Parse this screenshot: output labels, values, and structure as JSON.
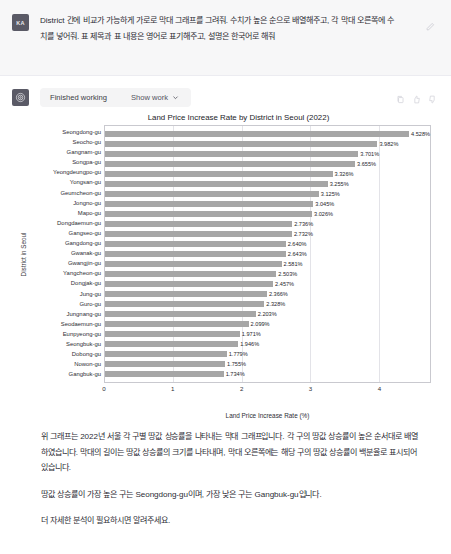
{
  "user": {
    "avatar_initials": "KA",
    "message": "District 간에 비교가 가능하게 가로로 막대 그래프를 그려줘. 수치가 높은 순으로 배열해주고, 각 막대 오른쪽에 수치를 넣어줘. 표 제목과 표 내용은 영어로 표기해주고, 설명은 한국어로 해줘",
    "edit_icon": "edit-icon"
  },
  "assistant": {
    "tool_status": "Finished working",
    "show_work_label": "Show work",
    "chevron_icon": "chevron-down-icon",
    "actions": [
      {
        "name": "copy-icon"
      },
      {
        "name": "thumbs-up-icon"
      },
      {
        "name": "thumbs-down-icon"
      }
    ],
    "paragraphs": [
      "위 그래프는 2022년 서울 각 구별 땅값 상승률을 나타내는 막대 그래프입니다. 각 구의 땅값 상승률이 높은 순서대로 배열하였습니다. 막대의 길이는 땅값 상승률의 크기를 나타내며, 막대 오른쪽에는 해당 구의 땅값 상승률이 백분율로 표시되어 있습니다.",
      "땅값 상승률이 가장 높은 구는 Seongdong-gu이며, 가장 낮은 구는 Gangbuk-gu입니다.",
      "더 자세한 분석이 필요하시면 알려주세요."
    ]
  },
  "chart_data": {
    "type": "bar",
    "orientation": "horizontal",
    "title": "Land Price Increase Rate by District in Seoul (2022)",
    "xlabel": "Land Price Increase Rate (%)",
    "ylabel": "District in Seoul",
    "xlim": [
      0,
      4.75
    ],
    "xticks": [
      0,
      1,
      2,
      3,
      4
    ],
    "grid": true,
    "bar_color": "#a6a6a6",
    "categories": [
      "Seongdong-gu",
      "Seocho-gu",
      "Gangnam-gu",
      "Songpa-gu",
      "Yeongdeungpo-gu",
      "Yongsan-gu",
      "Geumcheon-gu",
      "Jongno-gu",
      "Mapo-gu",
      "Dongdaemun-gu",
      "Gangseo-gu",
      "Gangdong-gu",
      "Gwanak-gu",
      "Gwangjin-gu",
      "Yangcheon-gu",
      "Dongjak-gu",
      "Jung-gu",
      "Guro-gu",
      "Jungnang-gu",
      "Seodaemun-gu",
      "Eunpyeong-gu",
      "Seongbuk-gu",
      "Dobong-gu",
      "Nowon-gu",
      "Gangbuk-gu"
    ],
    "values": [
      4.528,
      3.982,
      3.701,
      3.655,
      3.326,
      3.255,
      3.125,
      3.045,
      3.026,
      2.736,
      2.732,
      2.64,
      2.643,
      2.581,
      2.503,
      2.457,
      2.366,
      2.328,
      2.203,
      2.099,
      1.971,
      1.946,
      1.779,
      1.755,
      1.734
    ],
    "value_labels": [
      "4.528%",
      "3.982%",
      "3.701%",
      "3.655%",
      "3.326%",
      "3.255%",
      "3.125%",
      "3.045%",
      "3.026%",
      "2.736%",
      "2.732%",
      "2.640%",
      "2.643%",
      "2.581%",
      "2.503%",
      "2.457%",
      "2.366%",
      "2.328%",
      "2.203%",
      "2.099%",
      "1.971%",
      "1.946%",
      "1.779%",
      "1.755%",
      "1.734%"
    ]
  }
}
